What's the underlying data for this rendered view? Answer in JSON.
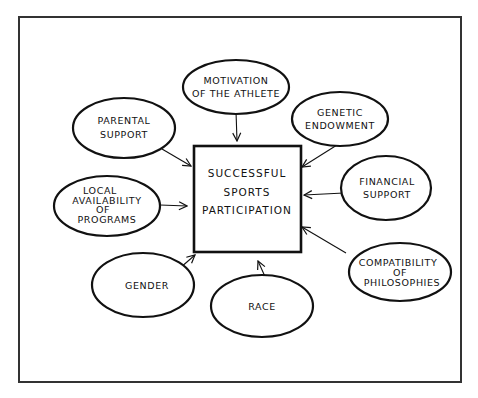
{
  "diagram": {
    "title": "",
    "center": {
      "lines": [
        "SUCCESSFUL",
        "SPORTS",
        "PARTICIPATION"
      ]
    },
    "factors": [
      {
        "id": "motivation",
        "lines": [
          "MOTIVATION",
          "OF THE ATHLETE"
        ]
      },
      {
        "id": "parental",
        "lines": [
          "PARENTAL",
          "SUPPORT"
        ]
      },
      {
        "id": "genetic",
        "lines": [
          "GENETIC",
          "ENDOWMENT"
        ]
      },
      {
        "id": "local",
        "lines": [
          "LOCAL",
          "AVAILABILITY",
          "OF",
          "PROGRAMS"
        ]
      },
      {
        "id": "financial",
        "lines": [
          "FINANCIAL",
          "SUPPORT"
        ]
      },
      {
        "id": "gender",
        "lines": [
          "GENDER"
        ]
      },
      {
        "id": "race",
        "lines": [
          "RACE"
        ]
      },
      {
        "id": "compatibility",
        "lines": [
          "COMPATIBILITY",
          "OF",
          "PHILOSOPHIES"
        ]
      }
    ],
    "edges": [
      {
        "from": "motivation",
        "to": "center"
      },
      {
        "from": "parental",
        "to": "center"
      },
      {
        "from": "genetic",
        "to": "center"
      },
      {
        "from": "local",
        "to": "center"
      },
      {
        "from": "financial",
        "to": "center"
      },
      {
        "from": "gender",
        "to": "center"
      },
      {
        "from": "race",
        "to": "center"
      },
      {
        "from": "compatibility",
        "to": "center"
      }
    ]
  }
}
